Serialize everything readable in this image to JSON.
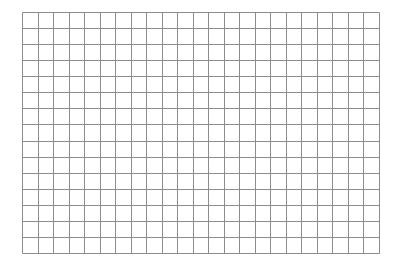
{
  "grid": {
    "columns": 23,
    "rows": 15,
    "line_color": "#8c8c8c",
    "background": "#ffffff",
    "width": 358,
    "height": 242
  }
}
